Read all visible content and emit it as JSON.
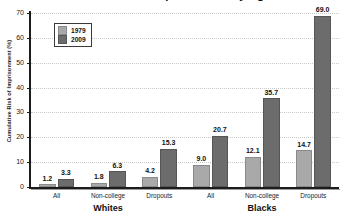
{
  "chart_data": {
    "type": "bar",
    "title": "Cumulative Risk of Imprisonment by Age 30-34",
    "xlabel": "",
    "ylabel": "Cumulative Risk of Imprisonment (%)",
    "ylim": [
      0,
      70
    ],
    "yticks": [
      0,
      10,
      20,
      30,
      40,
      50,
      60,
      70
    ],
    "grid": true,
    "legend_position": "top-left",
    "categories": [
      "All",
      "Non-college",
      "Dropouts",
      "All",
      "Non-college",
      "Dropouts"
    ],
    "groups": [
      {
        "name": "Whites",
        "categories": [
          "All",
          "Non-college",
          "Dropouts"
        ]
      },
      {
        "name": "Blacks",
        "categories": [
          "All",
          "Non-college",
          "Dropouts"
        ]
      }
    ],
    "series": [
      {
        "name": "1979",
        "color": "#a9a9a9",
        "values": [
          1.2,
          1.8,
          4.2,
          9.0,
          12.1,
          14.7
        ]
      },
      {
        "name": "2009",
        "color": "#6c6c6c",
        "values": [
          3.3,
          6.3,
          15.3,
          20.7,
          35.7,
          69.0
        ]
      }
    ],
    "value_labels": [
      "1.2",
      "3.3",
      "1.8",
      "6.3",
      "4.2",
      "15.3",
      "9.0",
      "20.7",
      "12.1",
      "35.7",
      "14.7",
      "69.0"
    ],
    "ytick_labels": [
      "0",
      "10",
      "20",
      "30",
      "40",
      "50",
      "60",
      "70"
    ]
  },
  "legend": {
    "items": [
      {
        "label": "1979",
        "color": "#a9a9a9"
      },
      {
        "label": "2009",
        "color": "#6c6c6c"
      }
    ]
  },
  "axis": {
    "y_title": "Cumulative Risk of Imprisonment (%)"
  },
  "colors": {
    "series_1979": "#a9a9a9",
    "series_2009": "#6c6c6c",
    "axis": "#1c1c1c",
    "grid": "#c9c9c9",
    "background": "#ffffff"
  }
}
